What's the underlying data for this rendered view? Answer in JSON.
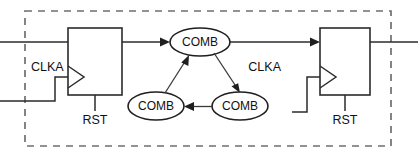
{
  "diagram": {
    "type": "digital-circuit-schematic",
    "colors": {
      "background": "#ffffff",
      "wire": "#2b2b2b",
      "shape_outline": "#1f1f1f",
      "boundary_dashed": "#6f6f6f",
      "text": "#111111"
    },
    "boundary": {
      "name": "clock-domain-boundary",
      "style": "dashed-rectangle",
      "x": 25,
      "y": 11,
      "width": 366,
      "height": 135
    },
    "flipflops": [
      {
        "id": "ff-left",
        "name": "left-flipflop",
        "clock_label": "CLKA",
        "reset_label": "RST",
        "x": 68,
        "y": 28,
        "width": 54,
        "height": 67
      },
      {
        "id": "ff-right",
        "name": "right-flipflop",
        "clock_label": "CLKA",
        "reset_label": "RST",
        "x": 320,
        "y": 28,
        "width": 50,
        "height": 67
      }
    ],
    "comb_blocks": [
      {
        "id": "comb-top",
        "name": "comb-block-top",
        "label": "COMB",
        "cx": 200,
        "cy": 42,
        "rx": 30,
        "ry": 14
      },
      {
        "id": "comb-bottom-right",
        "name": "comb-block-bottom-right",
        "label": "COMB",
        "cx": 240,
        "cy": 106,
        "rx": 28,
        "ry": 14
      },
      {
        "id": "comb-bottom-left",
        "name": "comb-block-bottom-left",
        "label": "COMB",
        "cx": 156,
        "cy": 106,
        "rx": 28,
        "ry": 14
      }
    ],
    "connections": [
      {
        "name": "input-data-wire",
        "from": "external-left",
        "to": "ff-left-d-input",
        "arrow": false
      },
      {
        "name": "left-clock-wire",
        "from": "external-left",
        "to": "ff-left-clk-input",
        "arrow": false
      },
      {
        "name": "ff-left-to-comb-top",
        "from": "ff-left-q-output",
        "to": "comb-top",
        "arrow": true
      },
      {
        "name": "comb-top-to-comb-bottom-right",
        "from": "comb-top",
        "to": "comb-bottom-right",
        "arrow": true
      },
      {
        "name": "comb-bottom-right-to-comb-bottom-left",
        "from": "comb-bottom-right",
        "to": "comb-bottom-left",
        "arrow": true
      },
      {
        "name": "comb-bottom-left-to-comb-top",
        "from": "comb-bottom-left",
        "to": "comb-top",
        "arrow": true
      },
      {
        "name": "comb-top-to-ff-right",
        "from": "comb-top",
        "to": "ff-right-d-input",
        "arrow": true
      },
      {
        "name": "right-clock-wire",
        "from": "external-left",
        "to": "ff-right-clk-input",
        "arrow": false
      },
      {
        "name": "output-data-wire",
        "from": "ff-right-q-output",
        "to": "external-right",
        "arrow": false
      }
    ],
    "labels": {
      "clka_left": "CLKA",
      "clka_right": "CLKA",
      "rst_left": "RST",
      "rst_right": "RST",
      "comb_top": "COMB",
      "comb_bottom_right": "COMB",
      "comb_bottom_left": "COMB"
    }
  }
}
